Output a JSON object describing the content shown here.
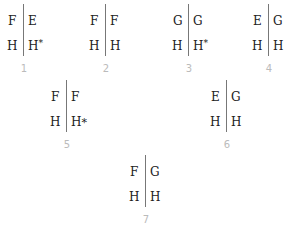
{
  "panels": [
    {
      "label": "1",
      "top_left": "F",
      "top_right": "E",
      "bottom_left": "H",
      "bottom_right": "H",
      "star": "*",
      "star_style": "superscript"
    },
    {
      "label": "2",
      "top_left": "F",
      "top_right": "F",
      "bottom_left": "H",
      "bottom_right": "H"
    },
    {
      "label": "3",
      "top_left": "G",
      "top_right": "G",
      "bottom_left": "H",
      "bottom_right": "H",
      "star": "*",
      "star_style": "superscript"
    },
    {
      "label": "4",
      "top_left": "E",
      "top_right": "G",
      "bottom_left": "H",
      "bottom_right": "H"
    },
    {
      "label": "5",
      "top_left": "F",
      "top_right": "F",
      "bottom_left": "H",
      "bottom_right": "H",
      "star": "*",
      "star_style": "inline"
    },
    {
      "label": "6",
      "top_left": "E",
      "top_right": "G",
      "bottom_left": "H",
      "bottom_right": "H"
    },
    {
      "label": "7",
      "top_left": "F",
      "top_right": "G",
      "bottom_left": "H",
      "bottom_right": "H"
    }
  ],
  "colors": {
    "text": "#222222",
    "divider": "#777777",
    "label": "#bbbbbb"
  }
}
